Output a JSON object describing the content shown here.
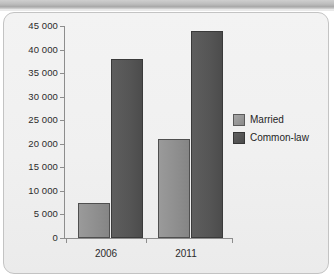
{
  "chart_data": {
    "type": "bar",
    "title": "",
    "xlabel": "",
    "ylabel": "",
    "categories": [
      "2006",
      "2011"
    ],
    "series": [
      {
        "name": "Married",
        "values": [
          7500,
          21000
        ],
        "color": "#8e8e8e"
      },
      {
        "name": "Common-law",
        "values": [
          38000,
          44000
        ],
        "color": "#555555"
      }
    ],
    "ylim": [
      0,
      45000
    ],
    "ytick_values": [
      0,
      5000,
      10000,
      15000,
      20000,
      25000,
      30000,
      35000,
      40000,
      45000
    ],
    "ytick_labels": [
      "0",
      "5 000",
      "10 000",
      "15 000",
      "20 000",
      "25 000",
      "30 000",
      "35 000",
      "40 000",
      "45 000"
    ],
    "grid": false,
    "legend_position": "right"
  },
  "legend": {
    "entries": [
      {
        "label": "Married"
      },
      {
        "label": "Common-law"
      }
    ]
  }
}
